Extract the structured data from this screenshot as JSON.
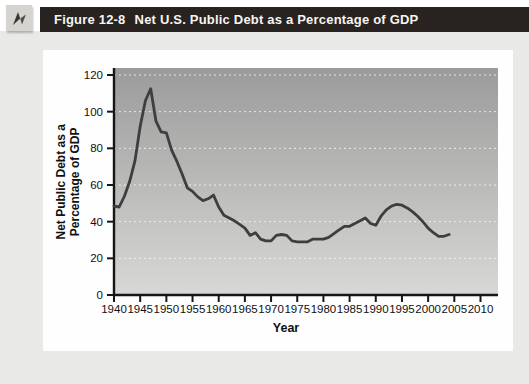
{
  "header": {
    "figure_label": "Figure 12-8",
    "figure_title": "Net U.S. Public Debt as a Percentage of GDP",
    "icon": "compass-arrow-icon",
    "bar_color": "#282221",
    "text_color": "#f7f5f1"
  },
  "chart_data": {
    "type": "line",
    "title": "Net U.S. Public Debt as a Percentage of GDP",
    "xlabel": "Year",
    "ylabel_line1": "Net Public Debt as a",
    "ylabel_line2": "Percentage of GDP",
    "xlim": [
      1940,
      2013
    ],
    "ylim": [
      0,
      120
    ],
    "x_ticks": [
      1940,
      1945,
      1950,
      1955,
      1960,
      1965,
      1970,
      1975,
      1980,
      1985,
      1990,
      1995,
      2000,
      2005,
      2010
    ],
    "y_ticks": [
      0,
      20,
      40,
      60,
      80,
      100,
      120
    ],
    "grid": "horizontal white dotted lines at each y tick",
    "legend": "none",
    "line_color": "#3e3e3e",
    "plot_bg_gradient_top": "#9b9b9b",
    "plot_bg_gradient_bottom": "#d8d8d6",
    "series": [
      {
        "name": "Net public debt as a percentage of GDP",
        "points": [
          [
            1940,
            48.5
          ],
          [
            1941,
            48
          ],
          [
            1942,
            54
          ],
          [
            1943,
            62
          ],
          [
            1944,
            73
          ],
          [
            1945,
            92
          ],
          [
            1946,
            106
          ],
          [
            1947,
            112.5
          ],
          [
            1948,
            95
          ],
          [
            1949,
            89
          ],
          [
            1950,
            88.5
          ],
          [
            1951,
            79
          ],
          [
            1952,
            73
          ],
          [
            1953,
            66
          ],
          [
            1954,
            58.5
          ],
          [
            1955,
            56.5
          ],
          [
            1956,
            53.5
          ],
          [
            1957,
            51.5
          ],
          [
            1958,
            52.5
          ],
          [
            1959,
            54.5
          ],
          [
            1960,
            48
          ],
          [
            1961,
            43.5
          ],
          [
            1962,
            42
          ],
          [
            1963,
            40.5
          ],
          [
            1964,
            38.5
          ],
          [
            1965,
            36.5
          ],
          [
            1966,
            32.5
          ],
          [
            1967,
            34
          ],
          [
            1968,
            30.5
          ],
          [
            1969,
            29.5
          ],
          [
            1970,
            29.5
          ],
          [
            1971,
            32.5
          ],
          [
            1972,
            33
          ],
          [
            1973,
            32.5
          ],
          [
            1974,
            29.5
          ],
          [
            1975,
            29
          ],
          [
            1976,
            29
          ],
          [
            1977,
            29
          ],
          [
            1978,
            30.5
          ],
          [
            1979,
            30.5
          ],
          [
            1980,
            30.5
          ],
          [
            1981,
            31.5
          ],
          [
            1982,
            33.5
          ],
          [
            1983,
            35.5
          ],
          [
            1984,
            37.5
          ],
          [
            1985,
            37.5
          ],
          [
            1986,
            39
          ],
          [
            1987,
            40.5
          ],
          [
            1988,
            42
          ],
          [
            1989,
            39
          ],
          [
            1990,
            38
          ],
          [
            1991,
            43
          ],
          [
            1992,
            46.5
          ],
          [
            1993,
            48.5
          ],
          [
            1994,
            49.5
          ],
          [
            1995,
            49
          ],
          [
            1996,
            47.5
          ],
          [
            1997,
            45.5
          ],
          [
            1998,
            43
          ],
          [
            1999,
            40
          ],
          [
            2000,
            36.5
          ],
          [
            2001,
            34
          ],
          [
            2002,
            32
          ],
          [
            2003,
            32
          ],
          [
            2004,
            33
          ]
        ]
      }
    ]
  }
}
